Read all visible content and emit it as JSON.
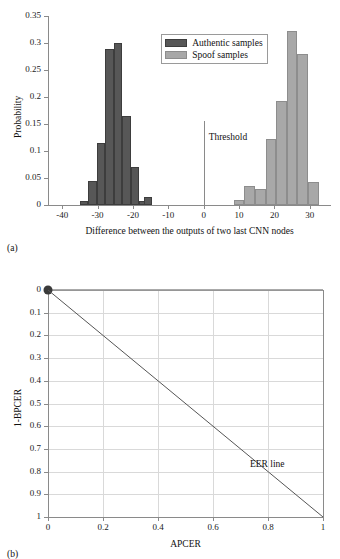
{
  "figure": {
    "panel_a_caption": "(a)",
    "panel_b_caption": "(b)"
  },
  "chart_data": [
    {
      "type": "bar",
      "panel": "(a)",
      "title": "",
      "xlabel": "Difference between the outputs of two last CNN nodes",
      "ylabel": "Probability",
      "xlim": [
        -44,
        36
      ],
      "ylim": [
        0,
        0.35
      ],
      "grid": false,
      "legend_position": "upper-center",
      "xticks": [
        "-40",
        "-30",
        "-20",
        "-10",
        "0",
        "10",
        "20",
        "30"
      ],
      "xtick_values": [
        -40,
        -30,
        -20,
        -10,
        0,
        10,
        20,
        30
      ],
      "yticks": [
        "0",
        "0.05",
        "0.1",
        "0.15",
        "0.2",
        "0.25",
        "0.3",
        "0.35"
      ],
      "ytick_values": [
        0,
        0.05,
        0.1,
        0.15,
        0.2,
        0.25,
        0.3,
        0.35
      ],
      "annotations": [
        {
          "text": "Threshold",
          "x": 0,
          "y": 0.13
        }
      ],
      "threshold": {
        "label": "Threshold",
        "x": 0,
        "y_top": 0.155
      },
      "series": [
        {
          "name": "Authentic samples",
          "color": "#575757",
          "bin_width": 2.4,
          "bins": [
            -35.0,
            -32.6,
            -30.2,
            -27.8,
            -25.4,
            -23.0,
            -20.6,
            -18.2
          ],
          "values": [
            0.007,
            0.045,
            0.114,
            0.288,
            0.3,
            0.164,
            0.07,
            0.008
          ]
        },
        {
          "name": "Authentic samples (tail)",
          "color": "#575757",
          "bin_width": 2.4,
          "bins": [
            -17.0
          ],
          "values": [
            0.014
          ]
        },
        {
          "name": "Spoof samples",
          "color": "#a8a8a8",
          "bin_width": 3.0,
          "bins": [
            8.5,
            11.5,
            14.5,
            17.5,
            20.5,
            23.5,
            26.5,
            29.5
          ],
          "values": [
            0.009,
            0.035,
            0.029,
            0.123,
            0.192,
            0.322,
            0.28,
            0.043
          ]
        }
      ]
    },
    {
      "type": "line",
      "panel": "(b)",
      "title": "",
      "xlabel": "APCER",
      "ylabel": "1-BPCER",
      "xlim": [
        0,
        1
      ],
      "ylim": [
        0,
        1
      ],
      "grid": true,
      "xticks": [
        "0",
        "0.2",
        "0.4",
        "0.6",
        "0.8",
        "1"
      ],
      "xtick_values": [
        0,
        0.2,
        0.4,
        0.6,
        0.8,
        1
      ],
      "yticks": [
        "0",
        "0.1",
        "0.2",
        "0.3",
        "0.4",
        "0.5",
        "0.6",
        "0.7",
        "0.8",
        "0.9",
        "1"
      ],
      "ytick_values": [
        0,
        0.1,
        0.2,
        0.3,
        0.4,
        0.5,
        0.6,
        0.7,
        0.8,
        0.9,
        1
      ],
      "annotations": [
        {
          "text": "EER line",
          "x": 0.8,
          "y": 0.23
        }
      ],
      "series": [
        {
          "name": "ROC curve",
          "color": "#555555",
          "marker": "filled-circle-at-origin-point",
          "x": [
            0,
            1
          ],
          "y": [
            1,
            1
          ]
        },
        {
          "name": "EER line",
          "color": "#555555",
          "x": [
            0,
            1
          ],
          "y": [
            1,
            0
          ]
        }
      ]
    }
  ],
  "panel_a": {
    "ylabel": "Probability",
    "xlabel": "Difference between the outputs of two last CNN nodes",
    "yticks": [
      "0.35",
      "0.3",
      "0.25",
      "0.2",
      "0.15",
      "0.1",
      "0.05",
      "0"
    ],
    "xticks": [
      "-40",
      "-30",
      "-20",
      "-10",
      "0",
      "10",
      "20",
      "30"
    ],
    "legend": {
      "authentic": "Authentic samples",
      "spoof": "Spoof samples"
    },
    "threshold_label": "Threshold"
  },
  "panel_b": {
    "ylabel": "1-BPCER",
    "xlabel": "APCER",
    "yticks": [
      "1",
      "0.9",
      "0.8",
      "0.7",
      "0.6",
      "0.5",
      "0.4",
      "0.3",
      "0.2",
      "0.1",
      "0"
    ],
    "xticks": [
      "0",
      "0.2",
      "0.4",
      "0.6",
      "0.8",
      "1"
    ],
    "eer_label": "EER line"
  },
  "colors": {
    "authentic_bar": "#575757",
    "spoof_bar": "#a8a8a8",
    "axis": "#8a8a8a",
    "grid": "#d9d9d9",
    "line": "#555555"
  }
}
